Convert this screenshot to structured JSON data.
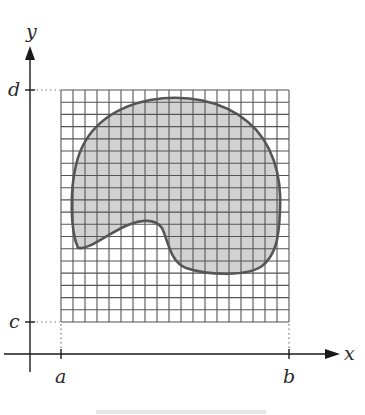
{
  "figure": {
    "type": "region-over-grid",
    "axes": {
      "x_label": "x",
      "y_label": "y"
    },
    "ticks": {
      "x": [
        {
          "label": "a",
          "px": 61
        },
        {
          "label": "b",
          "px": 289
        }
      ],
      "y": [
        {
          "label": "d",
          "px": 90
        },
        {
          "label": "c",
          "px": 322
        }
      ]
    },
    "grid": {
      "columns": 19,
      "rows": 19,
      "left": 61,
      "top": 90,
      "right": 289,
      "bottom": 322,
      "line_color": "#555555"
    },
    "region": {
      "fill": "#d2d2d2",
      "stroke": "#555555",
      "description": "Irregular closed region D enclosed in rectangle [a,b]x[c,d]"
    },
    "colors": {
      "axis": "#1a1a1a",
      "guide_dots": "#777777",
      "background": "#ffffff"
    }
  }
}
